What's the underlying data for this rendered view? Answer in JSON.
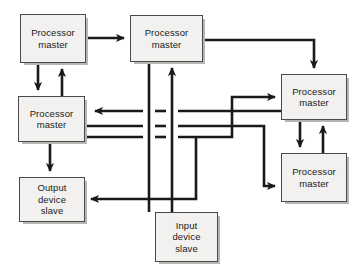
{
  "diagram": {
    "background_color": "#ffffff",
    "box_fill_color": "#f2f1ef",
    "box_border_color": "#4a4a4a",
    "box_shadow_color": "#b8b6b2",
    "wire_color": "#1a1a1a",
    "nodes": [
      {
        "id": "processor-master-top-left",
        "label": "Processor\nmaster",
        "role": "master",
        "x": 20,
        "y": 14,
        "w": 66,
        "h": 49
      },
      {
        "id": "processor-master-top-middle",
        "label": "Processor\nmaster",
        "role": "master",
        "x": 130,
        "y": 15,
        "w": 73,
        "h": 47
      },
      {
        "id": "processor-master-left",
        "label": "Processor\nmaster",
        "role": "master",
        "x": 18,
        "y": 96,
        "w": 67,
        "h": 46
      },
      {
        "id": "processor-master-upper-right",
        "label": "Processor\nmaster",
        "role": "master",
        "x": 281,
        "y": 74,
        "w": 66,
        "h": 46
      },
      {
        "id": "processor-master-lower-right",
        "label": "Processor\nmaster",
        "role": "master",
        "x": 281,
        "y": 153,
        "w": 66,
        "h": 49
      },
      {
        "id": "output-device-slave",
        "label": "Output\ndevice\nslave",
        "role": "slave",
        "x": 19,
        "y": 177,
        "w": 66,
        "h": 45
      },
      {
        "id": "input-device-slave",
        "label": "Input\ndevice\nslave",
        "role": "slave",
        "x": 155,
        "y": 212,
        "w": 63,
        "h": 50
      }
    ],
    "connections": [
      {
        "id": "top-left-to-top-middle",
        "from": "processor-master-top-left",
        "to": "processor-master-top-middle",
        "arrow": true
      },
      {
        "id": "top-left-down-to-left",
        "from": "processor-master-top-left",
        "to": "processor-master-left",
        "arrow": true
      },
      {
        "id": "left-up-to-top-left",
        "from": "processor-master-left",
        "to": "processor-master-top-left",
        "arrow": true
      },
      {
        "id": "top-middle-to-upper-right",
        "from": "processor-master-top-middle",
        "to": "processor-master-upper-right",
        "arrow": true
      },
      {
        "id": "upper-right-down-to-lower-right",
        "from": "processor-master-upper-right",
        "to": "processor-master-lower-right",
        "arrow": true
      },
      {
        "id": "lower-right-up-to-upper-right",
        "from": "processor-master-lower-right",
        "to": "processor-master-upper-right",
        "arrow": true
      },
      {
        "id": "left-down-to-output",
        "from": "processor-master-left",
        "to": "output-device-slave",
        "arrow": true
      },
      {
        "id": "bus-into-left",
        "from": "bus",
        "to": "processor-master-left",
        "arrow": true
      },
      {
        "id": "left-out-to-lower-right",
        "from": "processor-master-left",
        "to": "processor-master-lower-right",
        "arrow": true
      },
      {
        "id": "left-out-to-upper-right",
        "from": "processor-master-left",
        "to": "processor-master-upper-right",
        "arrow": true
      },
      {
        "id": "input-up-to-top-middle",
        "from": "input-device-slave",
        "to": "processor-master-top-middle",
        "arrow": true
      },
      {
        "id": "top-middle-down-to-bus",
        "from": "processor-master-top-middle",
        "to": "output-device-slave",
        "arrow": true
      },
      {
        "id": "bus-to-output",
        "from": "bus",
        "to": "output-device-slave",
        "arrow": true
      }
    ]
  }
}
